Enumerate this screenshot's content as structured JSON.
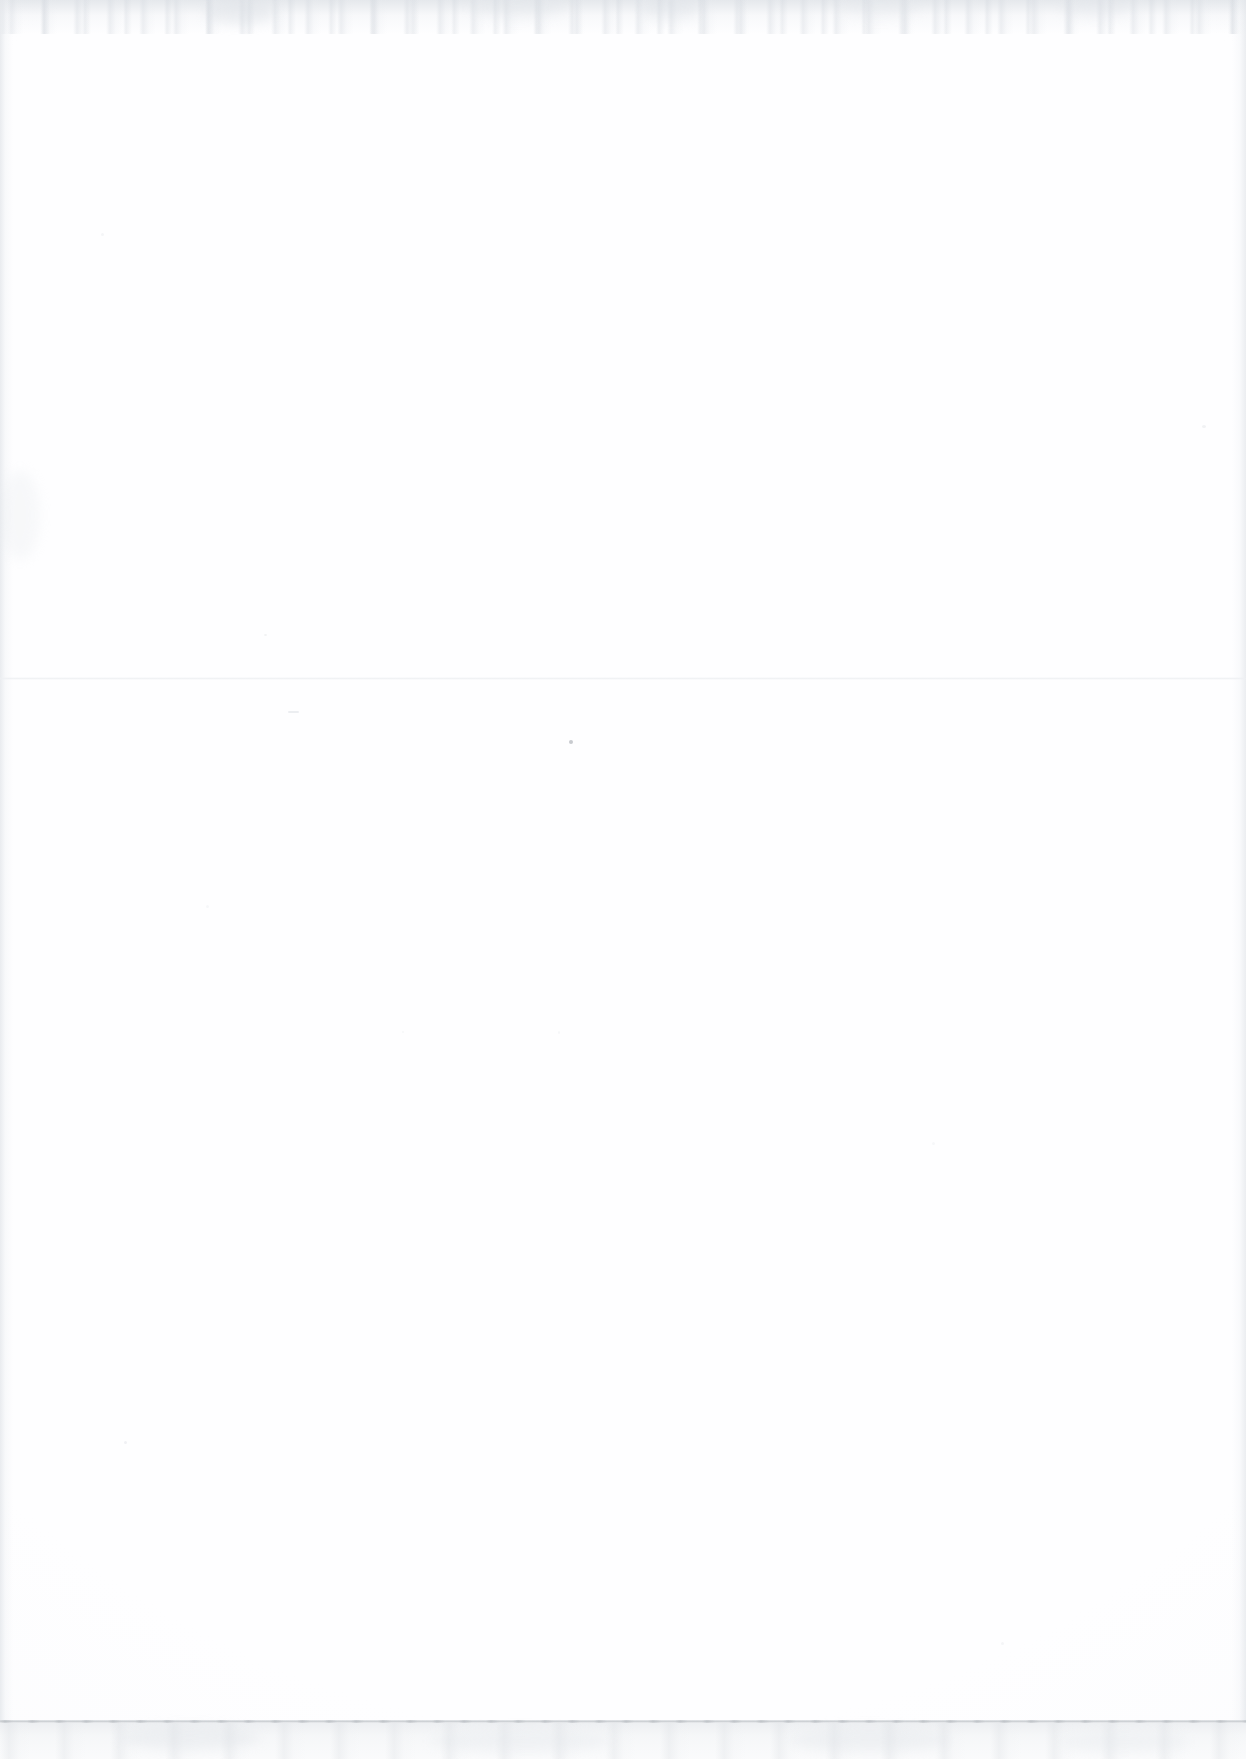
{
  "document": {
    "kind": "scanned-page",
    "content_text": "",
    "page_note": "Blank page — no printed text, headings, figures or tables are present.",
    "width_px": 1246,
    "height_px": 1759
  },
  "colors": {
    "paper": "#fefeff",
    "page_background": "#fefefe",
    "scanner_bed": "#f0f1f3",
    "edge_rule": "#c6cace",
    "edge_band": "#e4e7eb",
    "fold_line": "#eef0f3",
    "speck_dark": "#9aa0a8",
    "speck_faint": "#d8dce1"
  },
  "layout": {
    "sheet": {
      "x": 0,
      "y": 0,
      "width": 1246,
      "height": 1721
    },
    "edge_top": {
      "y": 0,
      "height": 34
    },
    "edge_left": {
      "x": 0,
      "width": 13
    },
    "edge_right": {
      "x": 1232,
      "width": 14
    },
    "fold_crease": {
      "y": 677
    },
    "page_edge_rule": {
      "y": 1720
    },
    "scanner_bed": {
      "y": 1723,
      "height": 36
    }
  },
  "marks": [
    {
      "name": "center-dot",
      "x": 569,
      "y": 740,
      "w": 4,
      "h": 4,
      "opacity": 0.55,
      "color": "#9aa0a8"
    },
    {
      "name": "upper-dash",
      "x": 288,
      "y": 711,
      "w": 11,
      "h": 2,
      "opacity": 0.3,
      "color": "#c4c9cf"
    },
    {
      "name": "left-speck",
      "x": 124,
      "y": 1441,
      "w": 3,
      "h": 3,
      "opacity": 0.28,
      "color": "#ccd1d6"
    },
    {
      "name": "mid-left-speck",
      "x": 264,
      "y": 634,
      "w": 3,
      "h": 2,
      "opacity": 0.26,
      "color": "#ccd1d6"
    },
    {
      "name": "right-speck",
      "x": 1202,
      "y": 425,
      "w": 4,
      "h": 3,
      "opacity": 0.26,
      "color": "#ccd1d6"
    },
    {
      "name": "lower-right-speck",
      "x": 1001,
      "y": 1642,
      "w": 3,
      "h": 3,
      "opacity": 0.22,
      "color": "#d2d6db"
    },
    {
      "name": "upper-mid-speck",
      "x": 206,
      "y": 905,
      "w": 3,
      "h": 3,
      "opacity": 0.2,
      "color": "#d6dadf"
    },
    {
      "name": "mid-speck",
      "x": 402,
      "y": 1031,
      "w": 2,
      "h": 2,
      "opacity": 0.2,
      "color": "#d6dadf"
    },
    {
      "name": "low-center-speck",
      "x": 558,
      "y": 1031,
      "w": 2,
      "h": 3,
      "opacity": 0.2,
      "color": "#d6dadf"
    },
    {
      "name": "top-left-speck",
      "x": 101,
      "y": 233,
      "w": 3,
      "h": 3,
      "opacity": 0.22,
      "color": "#d2d6db"
    },
    {
      "name": "right-low-speck",
      "x": 932,
      "y": 1142,
      "w": 3,
      "h": 3,
      "opacity": 0.2,
      "color": "#d6dadf"
    }
  ],
  "smudges": [
    {
      "name": "top-smudge-a",
      "x": 205,
      "y": 2,
      "w": 70,
      "h": 22,
      "opacity": 0.36,
      "color": "#d4d9df"
    },
    {
      "name": "top-smudge-b",
      "x": 470,
      "y": 0,
      "w": 95,
      "h": 18,
      "opacity": 0.3,
      "color": "#dadfe4"
    },
    {
      "name": "top-smudge-c",
      "x": 640,
      "y": 0,
      "w": 60,
      "h": 20,
      "opacity": 0.32,
      "color": "#d8dde3"
    },
    {
      "name": "top-smudge-d",
      "x": 840,
      "y": 1,
      "w": 80,
      "h": 16,
      "opacity": 0.26,
      "color": "#dee2e7"
    },
    {
      "name": "top-smudge-e",
      "x": 1060,
      "y": 0,
      "w": 70,
      "h": 18,
      "opacity": 0.28,
      "color": "#dce0e6"
    },
    {
      "name": "left-smudge",
      "x": 0,
      "y": 470,
      "w": 40,
      "h": 90,
      "opacity": 0.24,
      "color": "#e2e6ea"
    },
    {
      "name": "bot-smudge-a",
      "x": 120,
      "y": 1726,
      "w": 140,
      "h": 24,
      "opacity": 0.34,
      "color": "#dce0e5"
    },
    {
      "name": "bot-smudge-b",
      "x": 430,
      "y": 1730,
      "w": 180,
      "h": 22,
      "opacity": 0.3,
      "color": "#dfe3e8"
    },
    {
      "name": "bot-smudge-c",
      "x": 790,
      "y": 1728,
      "w": 160,
      "h": 24,
      "opacity": 0.32,
      "color": "#dde1e6"
    },
    {
      "name": "bot-smudge-d",
      "x": 1060,
      "y": 1732,
      "w": 130,
      "h": 20,
      "opacity": 0.28,
      "color": "#e0e4e9"
    }
  ]
}
